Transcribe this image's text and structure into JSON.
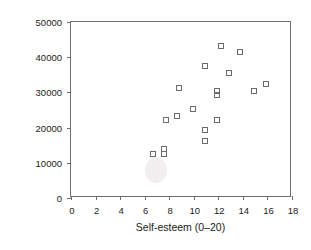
{
  "chart_data": {
    "type": "scatter",
    "title": "",
    "xlabel": "Self-esteem (0–20)",
    "ylabel": "Salary in £ per year",
    "xlim": [
      0,
      18
    ],
    "ylim": [
      0,
      50000
    ],
    "grid": false,
    "legend": null,
    "marker": "open-square",
    "marker_color": "#6b6b6b",
    "xticks": [
      0,
      2,
      4,
      6,
      8,
      10,
      12,
      14,
      16,
      18
    ],
    "xtick_labels": [
      "0",
      "2",
      "4",
      "6",
      "8",
      "10",
      "12",
      "14",
      "16",
      "18"
    ],
    "yticks": [
      0,
      10000,
      20000,
      30000,
      40000,
      50000
    ],
    "ytick_labels": [
      "0",
      "10000",
      "20000",
      "30000",
      "40000",
      "50000"
    ],
    "points": [
      {
        "x": 6.7,
        "y": 12400
      },
      {
        "x": 7.6,
        "y": 14000
      },
      {
        "x": 7.6,
        "y": 12400
      },
      {
        "x": 7.7,
        "y": 22200
      },
      {
        "x": 8.6,
        "y": 23400
      },
      {
        "x": 8.8,
        "y": 31200
      },
      {
        "x": 9.9,
        "y": 25200
      },
      {
        "x": 10.9,
        "y": 37500
      },
      {
        "x": 10.9,
        "y": 19300
      },
      {
        "x": 10.9,
        "y": 16300
      },
      {
        "x": 11.9,
        "y": 30300
      },
      {
        "x": 11.9,
        "y": 29300
      },
      {
        "x": 11.9,
        "y": 22300
      },
      {
        "x": 12.2,
        "y": 43300
      },
      {
        "x": 12.9,
        "y": 35500
      },
      {
        "x": 13.8,
        "y": 41500
      },
      {
        "x": 14.9,
        "y": 30500
      },
      {
        "x": 15.9,
        "y": 32500
      }
    ]
  }
}
